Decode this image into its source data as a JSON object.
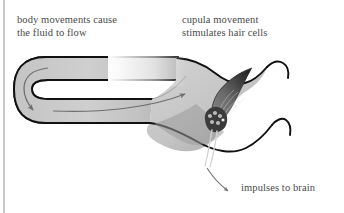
{
  "figure": {
    "type": "anatomical-diagram",
    "background_color": "#ffffff",
    "outline_color": "#111111",
    "canal_fill_color": "#c9c9c9",
    "cupula_color": "#6d6d6d",
    "arrow_color": "#6f6f6f",
    "margin_rule_color": "#c9c9c9"
  },
  "labels": {
    "fluid_flow": "body movements cause\nthe fluid to flow",
    "cupula": "cupula movement\nstimulates hair cells",
    "impulses": "impulses to brain"
  },
  "parts": {
    "canal_loop": "semicircular-canal",
    "ampulla": "ampulla",
    "cupula": "cupula",
    "hair_cells": "hair-cells",
    "nerve_fibers": "nerve-fibers"
  },
  "arrows": {
    "loop_flow": "endolymph-flow-in-loop",
    "main_flow": "endolymph-flow-toward-ampulla",
    "impulse": "impulses-to-brain-arrow"
  },
  "hair_cell_count": 6
}
